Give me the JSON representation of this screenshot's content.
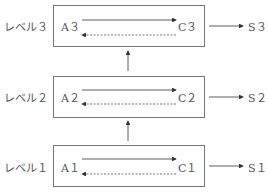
{
  "levels": [
    {
      "label": "レベル３",
      "a": "A３",
      "c": "C３",
      "s": "S３"
    },
    {
      "label": "レベル２",
      "a": "A２",
      "c": "C２",
      "s": "S２"
    },
    {
      "label": "レベル１",
      "a": "A１",
      "c": "C１",
      "s": "S１"
    }
  ],
  "colors": {
    "line": "#333333",
    "box_border": "#777777",
    "text": "#555555"
  }
}
